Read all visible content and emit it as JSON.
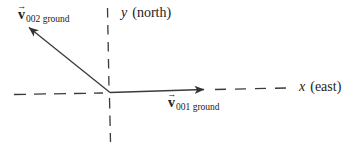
{
  "diagram": {
    "background_color": "#ffffff",
    "ink_color": "#3a3a3a",
    "y_axis_label": {
      "variable": "y",
      "annotation": "(north)"
    },
    "x_axis_label": {
      "variable": "x",
      "annotation": "(east)"
    },
    "vector_v002_label": {
      "arrow_glyph": "→",
      "symbol": "v",
      "subscript": "002 ground"
    },
    "vector_v001_label": {
      "arrow_glyph": "→",
      "symbol": "v",
      "subscript": "001 ground"
    }
  }
}
